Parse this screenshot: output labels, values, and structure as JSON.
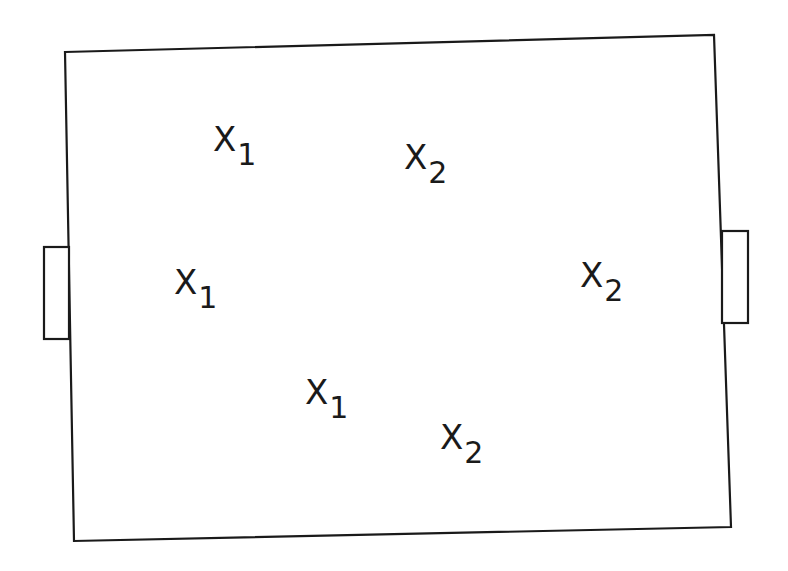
{
  "diagram": {
    "type": "playing-field",
    "stroke_color": "#1a1a1a",
    "background": "#ffffff",
    "field": {
      "corners": [
        [
          65,
          52
        ],
        [
          714,
          35
        ],
        [
          731,
          527
        ],
        [
          74,
          541
        ]
      ]
    },
    "goals": [
      {
        "side": "left",
        "x": 44,
        "y": 247,
        "width": 25,
        "height": 92
      },
      {
        "side": "right",
        "x": 722,
        "y": 231,
        "width": 26,
        "height": 92
      }
    ],
    "players": [
      {
        "label": "X",
        "sub": "1",
        "team": "1",
        "x": 213,
        "y": 122
      },
      {
        "label": "X",
        "sub": "1",
        "team": "1",
        "x": 174,
        "y": 265
      },
      {
        "label": "X",
        "sub": "1",
        "team": "1",
        "x": 305,
        "y": 375
      },
      {
        "label": "X",
        "sub": "2",
        "team": "2",
        "x": 404,
        "y": 140
      },
      {
        "label": "X",
        "sub": "2",
        "team": "2",
        "x": 580,
        "y": 258
      },
      {
        "label": "X",
        "sub": "2",
        "team": "2",
        "x": 440,
        "y": 420
      }
    ]
  }
}
